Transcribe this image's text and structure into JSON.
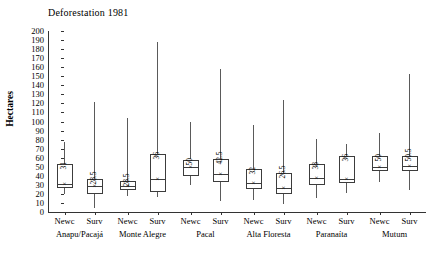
{
  "chart_data": {
    "type": "box",
    "title": "Deforestation 1981",
    "xlabel": "",
    "ylabel": "Hectares",
    "ylim": [
      0,
      200
    ],
    "ytick_step": 10,
    "yticks": [
      200,
      190,
      180,
      170,
      160,
      150,
      140,
      130,
      120,
      110,
      100,
      90,
      80,
      70,
      60,
      50,
      40,
      30,
      20,
      10,
      0
    ],
    "grid": false,
    "legend": "none",
    "groups": [
      {
        "name": "Anapu/Pacajá",
        "categories": [
          "Newc",
          "Surv"
        ]
      },
      {
        "name": "Monte Alegre",
        "categories": [
          "Newc",
          "Surv"
        ]
      },
      {
        "name": "Pacal",
        "categories": [
          "Newc",
          "Surv"
        ]
      },
      {
        "name": "Alta Floresta",
        "categories": [
          "Newc",
          "Surv"
        ]
      },
      {
        "name": "Paranaíta",
        "categories": [
          "Newc",
          "Surv"
        ]
      },
      {
        "name": "Mutum",
        "categories": [
          "Newc",
          "Surv"
        ]
      }
    ],
    "boxes": [
      {
        "group": "Anapu/Pacajá",
        "category": "Newc",
        "whisker_low": 20,
        "q1": 27,
        "median": 31,
        "q3": 53,
        "whisker_high": 77,
        "mean": 31,
        "median_label": "31"
      },
      {
        "group": "Anapu/Pacajá",
        "category": "Surv",
        "whisker_low": 4,
        "q1": 20,
        "median": 28.5,
        "q3": 37,
        "whisker_high": 122,
        "mean": 28.5,
        "median_label": "28.5"
      },
      {
        "group": "Monte Alegre",
        "category": "Newc",
        "whisker_low": 18,
        "q1": 24,
        "median": 28.5,
        "q3": 34,
        "whisker_high": 104,
        "mean": 28.5,
        "median_label": "28.5"
      },
      {
        "group": "Monte Alegre",
        "category": "Surv",
        "whisker_low": 17,
        "q1": 22,
        "median": 36,
        "q3": 64,
        "whisker_high": 188,
        "mean": 36,
        "median_label": "36"
      },
      {
        "group": "Pacal",
        "category": "Newc",
        "whisker_low": 30,
        "q1": 40,
        "median": 50,
        "q3": 58,
        "whisker_high": 99,
        "mean": 50,
        "median_label": "50"
      },
      {
        "group": "Pacal",
        "category": "Surv",
        "whisker_low": 12,
        "q1": 33,
        "median": 42.5,
        "q3": 59,
        "whisker_high": 158,
        "mean": 42.5,
        "median_label": "42.5"
      },
      {
        "group": "Alta Floresta",
        "category": "Newc",
        "whisker_low": 13,
        "q1": 25,
        "median": 32,
        "q3": 47,
        "whisker_high": 96,
        "mean": 32,
        "median_label": "32"
      },
      {
        "group": "Alta Floresta",
        "category": "Surv",
        "whisker_low": 9,
        "q1": 20,
        "median": 26.5,
        "q3": 43,
        "whisker_high": 124,
        "mean": 26.5,
        "median_label": "26.5"
      },
      {
        "group": "Paranaíta",
        "category": "Newc",
        "whisker_low": 16,
        "q1": 30,
        "median": 38,
        "q3": 53,
        "whisker_high": 81,
        "mean": 38,
        "median_label": "38"
      },
      {
        "group": "Paranaíta",
        "category": "Surv",
        "whisker_low": 21,
        "q1": 32,
        "median": 36,
        "q3": 62,
        "whisker_high": 75,
        "mean": 36,
        "median_label": "36"
      },
      {
        "group": "Mutum",
        "category": "Newc",
        "whisker_low": 33,
        "q1": 45,
        "median": 50,
        "q3": 62,
        "whisker_high": 87,
        "mean": 50,
        "median_label": "50"
      },
      {
        "group": "Mutum",
        "category": "Surv",
        "whisker_low": 24,
        "q1": 45,
        "median": 50.5,
        "q3": 62,
        "whisker_high": 152,
        "mean": 50.5,
        "median_label": "50.5"
      }
    ]
  }
}
